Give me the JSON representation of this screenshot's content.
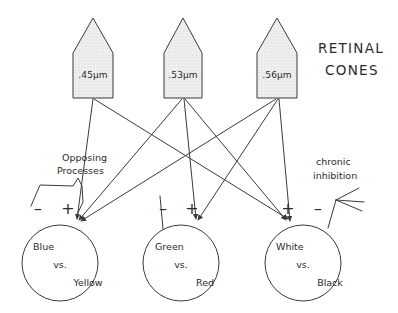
{
  "heading": {
    "line1": "RETINAL",
    "line2": "CONES"
  },
  "cones": [
    {
      "id": "cone-short-wavelength",
      "label": ".45µm"
    },
    {
      "id": "cone-medium-wavelength",
      "label": ".53µm"
    },
    {
      "id": "cone-long-wavelength",
      "label": ".56µm"
    }
  ],
  "annotations": {
    "opposing": {
      "line1": "Opposing",
      "line2": "Processes"
    },
    "chronic": {
      "line1": "chronic",
      "line2": "inhibition"
    }
  },
  "channels": [
    {
      "id": "blue-yellow",
      "line1": "Blue",
      "line2": "vs.",
      "line3": "Yellow",
      "sign_left": "–",
      "sign_right": "+"
    },
    {
      "id": "green-red",
      "line1": "Green",
      "line2": "vs.",
      "line3": "Red",
      "sign_left": "–",
      "sign_right": "+"
    },
    {
      "id": "white-black",
      "line1": "White",
      "line2": "vs.",
      "line3": "Black",
      "sign_left": "+",
      "sign_right": "–"
    }
  ],
  "colors": {
    "ink": "#3a3a3a",
    "text": "#2b2b2b",
    "cone_fill": "#ededed",
    "background": "#ffffff"
  }
}
